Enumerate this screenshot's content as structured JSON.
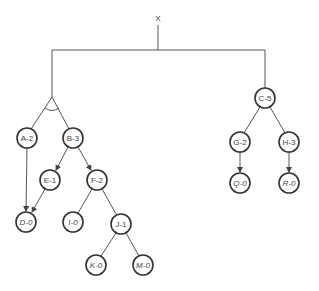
{
  "diagram": {
    "type": "and-or-tree",
    "root": {
      "label": "X"
    },
    "nodes": [
      {
        "id": "A",
        "label": "A-2",
        "italic": false
      },
      {
        "id": "B",
        "label": "B-3",
        "italic": false
      },
      {
        "id": "C",
        "label": "C-5",
        "italic": false
      },
      {
        "id": "E",
        "label": "E-1",
        "italic": false
      },
      {
        "id": "F",
        "label": "F-2",
        "italic": false
      },
      {
        "id": "G",
        "label": "G-2",
        "italic": false
      },
      {
        "id": "H",
        "label": "H-3",
        "italic": false
      },
      {
        "id": "D",
        "label": "D-0",
        "italic": true
      },
      {
        "id": "I",
        "label": "I-0",
        "italic": true
      },
      {
        "id": "J",
        "label": "J-1",
        "italic": false
      },
      {
        "id": "Q",
        "label": "Q-0",
        "italic": true
      },
      {
        "id": "R",
        "label": "R-0",
        "italic": true
      },
      {
        "id": "K",
        "label": "K-0",
        "italic": true
      },
      {
        "id": "M",
        "label": "M-0",
        "italic": true
      }
    ],
    "edges": [
      {
        "from": "X",
        "to": "AND(A,B)"
      },
      {
        "from": "X",
        "to": "C"
      },
      {
        "from": "A",
        "to": "D",
        "arrow": true
      },
      {
        "from": "B",
        "to": "E",
        "arrow": true
      },
      {
        "from": "B",
        "to": "F",
        "arrow": true
      },
      {
        "from": "E",
        "to": "D",
        "arrow": true
      },
      {
        "from": "F",
        "to": "I",
        "arrow": false
      },
      {
        "from": "F",
        "to": "J",
        "arrow": false
      },
      {
        "from": "J",
        "to": "K",
        "arrow": false
      },
      {
        "from": "J",
        "to": "M",
        "arrow": false
      },
      {
        "from": "C",
        "to": "G",
        "arrow": false
      },
      {
        "from": "C",
        "to": "H",
        "arrow": false
      },
      {
        "from": "G",
        "to": "Q",
        "arrow": true
      },
      {
        "from": "H",
        "to": "R",
        "arrow": true
      }
    ]
  }
}
